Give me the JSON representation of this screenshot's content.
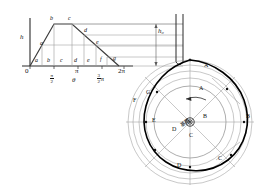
{
  "figure": {
    "colors": {
      "line": "#3c3c3c",
      "profile": "#000000",
      "thin": "#8a8a8a",
      "axis": "#2b2b2b"
    }
  },
  "displacement_diagram": {
    "y_axis_label": "h",
    "x_axis_label": "θ",
    "origin_label": "0",
    "x_ticks": [
      {
        "label": "0",
        "type": "plain"
      },
      {
        "label": "π/2",
        "type": "fraction",
        "num": "π",
        "den": "2"
      },
      {
        "label": "π",
        "type": "plain"
      },
      {
        "label": "3/2 π",
        "type": "fraction",
        "num": "3",
        "den": "2",
        "suffix": "π"
      },
      {
        "label": "2π",
        "type": "plain"
      }
    ],
    "curve_point_labels": [
      "a",
      "b",
      "c",
      "d",
      "e",
      "f",
      "g"
    ],
    "axis_segment_labels": [
      "a",
      "b",
      "c",
      "d",
      "e",
      "f",
      "g"
    ],
    "rise_label": "h",
    "profile_shape": "trapezoid"
  },
  "cam_construction": {
    "lift_label": "h₀",
    "base_circle_label": "基圆",
    "rotation_arrow": "counterclockwise",
    "center_label": "",
    "profile_points": [
      {
        "id": "A1",
        "label": "A"
      },
      {
        "id": "A2",
        "label": "A"
      },
      {
        "id": "B1",
        "label": "B"
      },
      {
        "id": "B2",
        "label": "B"
      },
      {
        "id": "C1",
        "label": "C"
      },
      {
        "id": "C2",
        "label": "C"
      },
      {
        "id": "D1",
        "label": "D"
      },
      {
        "id": "D2",
        "label": "D"
      },
      {
        "id": "E",
        "label": "E"
      },
      {
        "id": "F",
        "label": "F"
      },
      {
        "id": "G",
        "label": "G"
      }
    ],
    "follower": "flat-faced translating follower stem"
  }
}
